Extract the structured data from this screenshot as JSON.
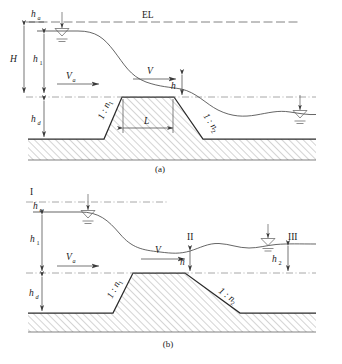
{
  "figure": {
    "title_visible": false,
    "panels": [
      {
        "id": "a",
        "caption": "(a)",
        "labels": {
          "energy_line": "EL",
          "head_total": "H",
          "velocity_head": "h",
          "velocity_head_sub": "a",
          "upstream_depth": "h",
          "upstream_depth_sub": "1",
          "embankment_height": "h",
          "embankment_height_sub": "d",
          "crest_depth": "h",
          "approach_velocity": "V",
          "approach_velocity_sub": "a",
          "crest_velocity": "V",
          "crest_length": "L",
          "upstream_slope": "1 : n",
          "upstream_slope_sub": "1",
          "downstream_slope": "1 : n",
          "downstream_slope_sub": "2"
        }
      },
      {
        "id": "b",
        "caption": "(b)",
        "labels": {
          "section_one": "I",
          "section_two": "II",
          "section_three": "III",
          "velocity_head": "h",
          "velocity_head_sub": "a",
          "upstream_depth": "h",
          "upstream_depth_sub": "1",
          "embankment_height": "h",
          "embankment_height_sub": "d",
          "downstream_depth": "h",
          "downstream_depth_sub": "2",
          "crest_depth": "h",
          "approach_velocity": "V",
          "approach_velocity_sub": "a",
          "crest_velocity": "V",
          "upstream_slope": "1 : n",
          "upstream_slope_sub": "1",
          "downstream_slope": "1 : n",
          "downstream_slope_sub": "2"
        }
      }
    ],
    "colors": {
      "ground_stroke": "#2b2b2b",
      "water_stroke": "#4a4a4a",
      "dash_stroke": "#5a5a5a",
      "hatch_stroke": "#6e6e6e",
      "text": "#1a1a1a",
      "background": "#ffffff"
    }
  }
}
